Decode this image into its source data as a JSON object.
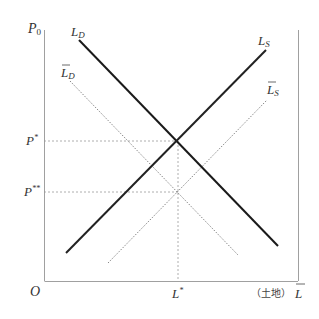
{
  "diagram": {
    "type": "supply-demand",
    "y_axis_label": "P",
    "y_axis_sub": "0",
    "origin_label": "O",
    "x_axis_label": "L",
    "x_axis_prefix": "（土地）",
    "equilibrium_price_label": "P",
    "equilibrium_price_sup": "*",
    "new_price_label": "P",
    "new_price_sup": "**",
    "equilibrium_quantity_label": "L",
    "equilibrium_quantity_sup": "*",
    "curves": [
      {
        "name": "L",
        "sub": "D",
        "tilde": false,
        "style": "solid",
        "role": "demand"
      },
      {
        "name": "L",
        "sub": "S",
        "tilde": false,
        "style": "solid",
        "role": "supply"
      },
      {
        "name": "L",
        "sub": "D",
        "tilde": true,
        "style": "dotted",
        "role": "shifted-demand"
      },
      {
        "name": "L",
        "sub": "S",
        "tilde": true,
        "style": "dotted",
        "role": "shifted-supply"
      }
    ],
    "colors": {
      "solid": "#1a1a1a",
      "dotted": "#888888",
      "axis": "#999999"
    }
  }
}
